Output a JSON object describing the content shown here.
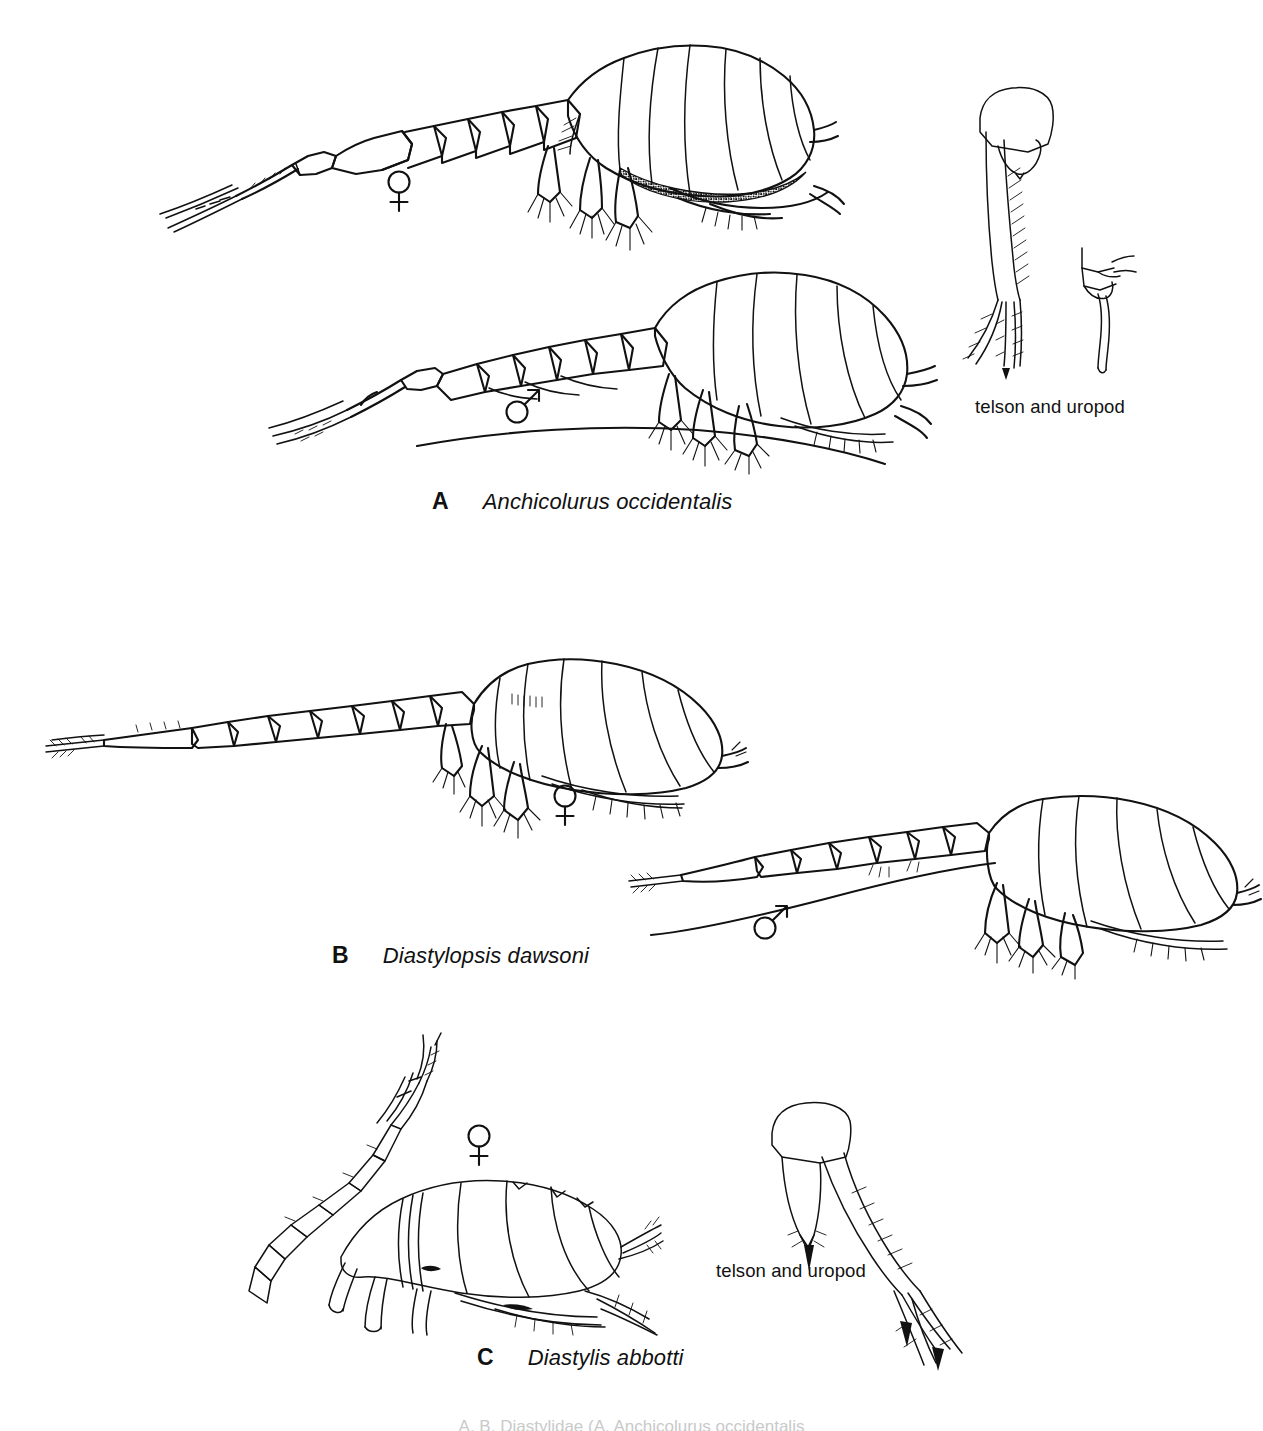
{
  "figure": {
    "kind": "taxonomic-plate",
    "background_color": "#ffffff",
    "ink_color": "#111111"
  },
  "panels": [
    {
      "letter": "A",
      "species": "Anchicolurus occidentalis",
      "specimens": [
        {
          "sex": "female",
          "symbol": "♀",
          "shading": "stippled"
        },
        {
          "sex": "male",
          "symbol": "♂",
          "shading": "outline"
        }
      ],
      "detail_label": "telson and uropod"
    },
    {
      "letter": "B",
      "species": "Diastylopsis dawsoni",
      "specimens": [
        {
          "sex": "female",
          "symbol": "♀",
          "shading": "outline"
        },
        {
          "sex": "male",
          "symbol": "♂",
          "shading": "outline"
        }
      ],
      "detail_label": null
    },
    {
      "letter": "C",
      "species": "Diastylis abbotti",
      "specimens": [
        {
          "sex": "female",
          "symbol": "♀",
          "shading": "outline"
        }
      ],
      "detail_label": "telson and uropod"
    }
  ],
  "labels": {
    "panel_a_letter": "A",
    "panel_a_species": "Anchicolurus occidentalis",
    "panel_b_letter": "B",
    "panel_b_species": "Diastylopsis dawsoni",
    "panel_c_letter": "C",
    "panel_c_species": "Diastylis abbotti",
    "telson_uropod_a": "telson and uropod",
    "telson_uropod_c": "telson and uropod",
    "female_symbol": "♀",
    "male_symbol": "♂"
  },
  "bottom_caption": "A, B, Diastylidae (A, Anchicolurus occidentalis"
}
